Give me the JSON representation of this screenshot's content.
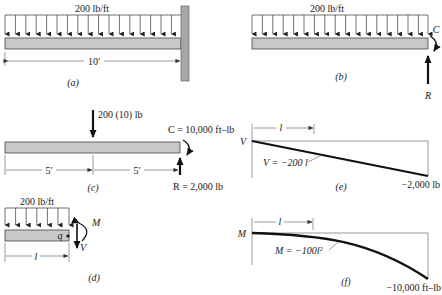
{
  "panels": {
    "a": {
      "caption": "(a)",
      "load_label": "200 lb/ft",
      "span_label": "10′"
    },
    "b": {
      "caption": "(b)",
      "load_label": "200 lb/ft",
      "moment_label": "C",
      "reaction_label": "R"
    },
    "c": {
      "caption": "(c)",
      "point_load_label": "200 (10) lb",
      "moment_label": "C = 10,000 ft–lb",
      "reaction_label": "R = 2,000 lb",
      "left_span_label": "5′",
      "right_span_label": "5′"
    },
    "d": {
      "caption": "(d)",
      "load_label": "200 lb/ft",
      "section_point_label": "q",
      "moment_label": "M",
      "shear_label": "V",
      "length_label": "l"
    },
    "e": {
      "caption": "(e)",
      "axis_label": "V",
      "length_label": "l",
      "equation_label": "V = −200 l",
      "end_value_label": "−2,000 lb"
    },
    "f": {
      "caption": "(f)",
      "axis_label": "M",
      "length_label": "l",
      "equation_label": "M = −100l²",
      "end_value_label": "−10,000 ft–lb"
    }
  },
  "colors": {
    "beam_fill": "#c8c8c8",
    "wall_fill": "#a8a8a8",
    "line": "#111111"
  }
}
